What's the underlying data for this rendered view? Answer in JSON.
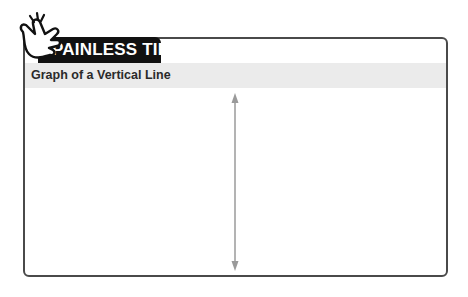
{
  "tip": {
    "badge_label": "PAINLESS TIP",
    "icon": "snapping-hand-icon"
  },
  "panel": {
    "title": "Graph of a Vertical Line"
  },
  "diagram": {
    "element": "vertical-line-with-arrows",
    "line_color": "#9a9a9a",
    "frame_color": "#4a4a4a",
    "header_band_color": "#ebebeb",
    "badge_color": "#111111"
  }
}
